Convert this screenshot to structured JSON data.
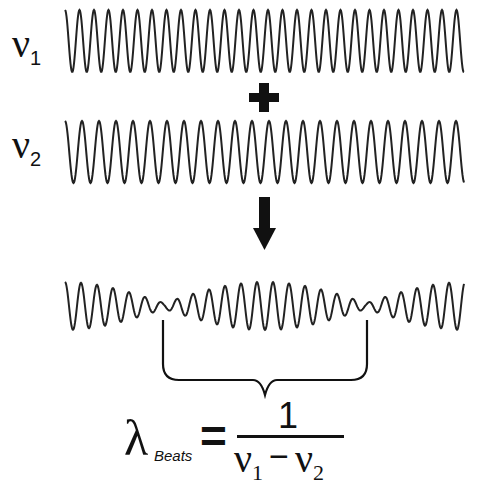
{
  "labels": {
    "wave1": {
      "symbol": "ν",
      "subscript": "1"
    },
    "wave2": {
      "symbol": "ν",
      "subscript": "2"
    },
    "plus": "+",
    "arrow": "down-arrow"
  },
  "formula": {
    "lhs_symbol": "λ",
    "lhs_subscript": "Beats",
    "equals": "=",
    "numerator": "1",
    "den_sym1": "ν",
    "den_sub1": "1",
    "den_minus": "−",
    "den_sym2": "ν",
    "den_sub2": "2"
  },
  "waves": {
    "color": "#222222",
    "x_start": 65,
    "x_end": 464,
    "wave1": {
      "center_y": 41,
      "amplitude": 31,
      "period": 14.5,
      "phase": 0.0
    },
    "wave2": {
      "center_y": 152,
      "amplitude": 31,
      "period": 17.0,
      "phase": 0.0
    },
    "beat": {
      "center_y": 306,
      "amplitude": 24,
      "carrier_period": 16.0,
      "envelope_period": 404,
      "envelope_center_x": 265,
      "node_xs": [
        165,
        367
      ]
    }
  },
  "brace": {
    "left_x": 163,
    "right_x": 367,
    "top_y": 320,
    "bottom_y": 380,
    "tip_x": 265,
    "tip_y": 395
  }
}
